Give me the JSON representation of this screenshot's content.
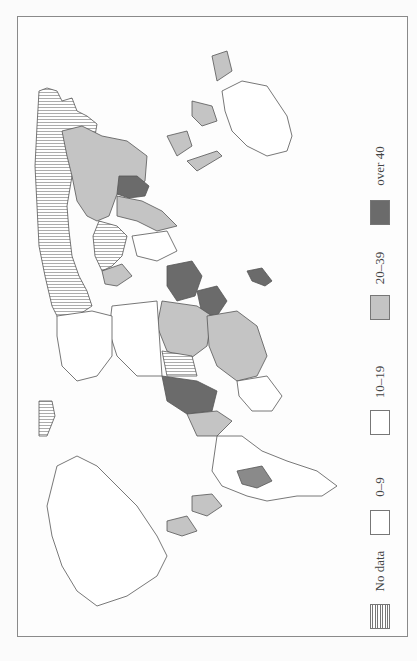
{
  "map": {
    "orientation": "rotated -90 degrees (world map printed sideways)",
    "colors": {
      "over_40": "#6b6b6b",
      "20_39": "#bdbdbd",
      "10_19": "#ffffff",
      "0_9": "#ffffff",
      "no_data": "hatched",
      "outline": "#555555"
    }
  },
  "legend": {
    "items": [
      {
        "label": "over 40",
        "fill": "#6b6b6b",
        "pattern": "solid"
      },
      {
        "label": "20–39",
        "fill": "#c4c4c4",
        "pattern": "solid"
      },
      {
        "label": "10–19",
        "fill": "#ffffff",
        "pattern": "solid"
      },
      {
        "label": "0–9",
        "fill": "#ffffff",
        "pattern": "solid"
      },
      {
        "label": "No data",
        "fill": "#ffffff",
        "pattern": "hatched"
      }
    ]
  }
}
